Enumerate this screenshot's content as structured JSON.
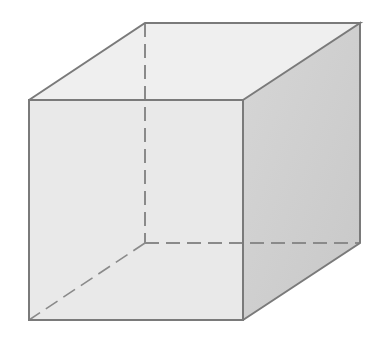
{
  "diagram": {
    "type": "cube",
    "colors": {
      "background": "#ffffff",
      "edge": "#7a7a7a",
      "hidden_edge": "#8a8a8a",
      "front_face": "#e9e9e9",
      "top_face": "#efefef",
      "right_face": "#cfcfcf"
    },
    "vertices": {
      "front_top_left": [
        29,
        100
      ],
      "front_top_right": [
        243,
        100
      ],
      "front_bottom_left": [
        29,
        320
      ],
      "front_bottom_right": [
        243,
        320
      ],
      "back_top_left": [
        145,
        23
      ],
      "back_top_right": [
        360,
        23
      ],
      "back_bottom_left": [
        145,
        243
      ],
      "back_bottom_right": [
        360,
        243
      ]
    },
    "dash_pattern": "14 7"
  }
}
